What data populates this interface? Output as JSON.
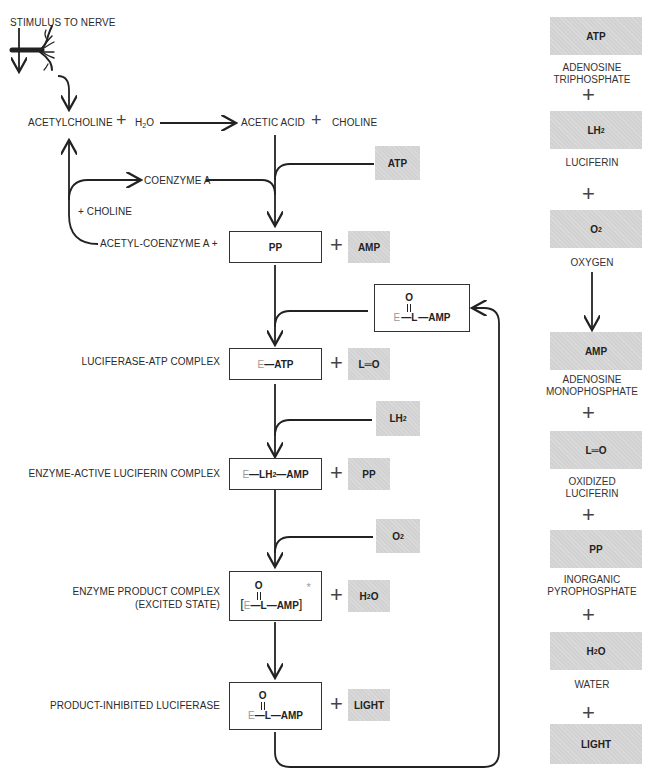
{
  "diagram": {
    "stimulus": "STIMULUS TO NERVE",
    "hydrolysis": {
      "reactant1": "ACETYLCHOLINE",
      "plus": "+",
      "reactant2_base": "H",
      "reactant2_sub": "2",
      "reactant2_end": "O",
      "product1": "ACETIC ACID",
      "product2": "CHOLINE"
    },
    "coenzyme_a": "COENZYME A",
    "plus_choline": "+ CHOLINE",
    "acetyl_coenzyme_a": "ACETYL-COENZYME A +",
    "steps": [
      {
        "label": "",
        "box": "PP",
        "byproduct": "AMP",
        "input": "ATP"
      },
      {
        "label": "LUCIFERASE-ATP COMPLEX",
        "box_e": "E",
        "box_main": "—ATP",
        "byproduct": "L═O",
        "input_base": "LH",
        "input_sub": "2"
      },
      {
        "label": "ENZYME-ACTIVE LUCIFERIN COMPLEX",
        "box_e": "E",
        "box_main1": "—LH",
        "box_sub": "2",
        "box_main2": "—AMP",
        "byproduct": "PP",
        "input_base": "O",
        "input_sub": "2"
      },
      {
        "label_line1": "ENZYME PRODUCT COMPLEX",
        "label_line2": "(EXCITED STATE)",
        "bracket_open": "[",
        "box_e": "E",
        "box_main": "—L—AMP",
        "bracket_close": "]",
        "star": "*",
        "byproduct_base": "H",
        "byproduct_sub": "2",
        "byproduct_end": "O"
      },
      {
        "label": "PRODUCT-INHIBITED LUCIFERASE",
        "box_e": "E",
        "box_main": "—L—AMP",
        "byproduct": "LIGHT"
      }
    ],
    "recycle_box": {
      "e": "E",
      "main": "—L—AMP",
      "oxygen": "O"
    }
  },
  "legend": {
    "items": [
      {
        "symbol": "ATP",
        "name_line1": "ADENOSINE",
        "name_line2": "TRIPHOSPHATE"
      },
      {
        "symbol_base": "LH",
        "symbol_sub": "2",
        "name_line1": "LUCIFERIN",
        "name_line2": ""
      },
      {
        "symbol_base": "O",
        "symbol_sub": "2",
        "name_line1": "OXYGEN",
        "name_line2": ""
      },
      {
        "symbol": "AMP",
        "name_line1": "ADENOSINE",
        "name_line2": "MONOPHOSPHATE"
      },
      {
        "symbol": "L═O",
        "name_line1": "OXIDIZED",
        "name_line2": "LUCIFERIN"
      },
      {
        "symbol": "PP",
        "name_line1": "INORGANIC",
        "name_line2": "PYROPHOSPHATE"
      },
      {
        "symbol_base": "H",
        "symbol_sub": "2",
        "symbol_end": "O",
        "name_line1": "WATER",
        "name_line2": ""
      },
      {
        "symbol": "LIGHT",
        "name_line1": "",
        "name_line2": ""
      }
    ],
    "plus": "+"
  },
  "colors": {
    "gray_box": "#d2d2d2",
    "line": "#222222",
    "enzyme_letter": "#999999"
  }
}
